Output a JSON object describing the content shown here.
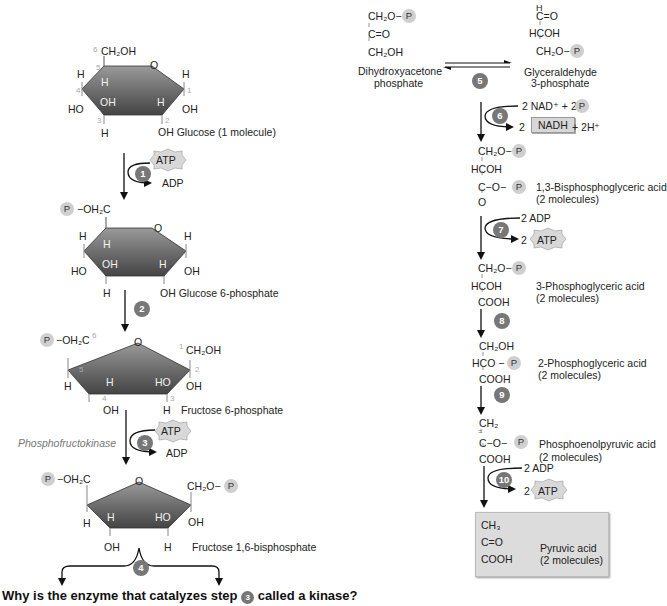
{
  "diagram": {
    "colors": {
      "ring_dark": "#555555",
      "ring_light": "#8a8a8a",
      "phosphate_bg": "#cfcfcf",
      "step_bg": "#777777",
      "highlight_box": "#dcdcdc"
    },
    "phosphate_label": "P",
    "glucose": {
      "name": "OH Glucose (1 molecule)",
      "c6": "CH₂OH",
      "ring_O": "O",
      "numbers": [
        "1",
        "2",
        "3",
        "4",
        "5",
        "6"
      ],
      "subs": {
        "h_left": "H",
        "ho_left": "HO",
        "h_c5": "H",
        "oh_c3": "OH",
        "h_c2": "H",
        "h_right": "H",
        "oh_right": "OH",
        "h_bottom": "H"
      }
    },
    "step1": {
      "number": "1",
      "in": "ATP",
      "out": "ADP"
    },
    "glucose6p": {
      "name": "OH Glucose 6-phosphate",
      "c6": "−OH₂C",
      "subs": {
        "h_left": "H",
        "ho_left": "HO",
        "h_c5": "H",
        "oh_c3": "OH",
        "h_c2": "H",
        "h_right": "H",
        "oh_right": "OH",
        "h_bottom": "H"
      }
    },
    "step2": {
      "number": "2"
    },
    "fructose6p": {
      "name": "Fructose 6-phosphate",
      "c6": "−OH₂C",
      "c1": "CH₂OH",
      "subs": {
        "h_c5": "H",
        "h_c4": "H",
        "ho_c3": "HO",
        "oh_c2": "OH",
        "oh_c4": "OH",
        "h_c3": "H"
      }
    },
    "step3": {
      "number": "3",
      "enzyme": "Phosphofructokinase",
      "in": "ATP",
      "out": "ADP"
    },
    "fructose16bp": {
      "name": "Fructose 1,6-bisphosphate",
      "c6": "−OH₂C",
      "c1": "CH₂O−",
      "subs": {
        "h_c5": "H",
        "h_c4": "H",
        "ho_c3": "HO",
        "oh_c2": "OH",
        "oh_c4": "OH",
        "h_c3": "H"
      }
    },
    "step4": {
      "number": "4"
    },
    "dhap": {
      "lines": [
        "CH₂O−",
        "C=O",
        "CH₂OH"
      ],
      "name": [
        "Dihydroxyacetone",
        "phosphate"
      ]
    },
    "step5": {
      "number": "5"
    },
    "g3p": {
      "lines": [
        "H",
        "C=O",
        "HCOH",
        "CH₂O−"
      ],
      "name": [
        "Glyceraldehyde",
        "3-phosphate"
      ]
    },
    "step6": {
      "number": "6",
      "in": "2 NAD⁺ + 2",
      "out_prefix": "2",
      "out_box": "NADH",
      "out_suffix": "+ 2H⁺"
    },
    "bpg13": {
      "lines": [
        "CH₂O−",
        "HCOH",
        "C−O−",
        "O"
      ],
      "name": "1,3-Bisphosphoglyceric acid",
      "count": "(2 molecules)"
    },
    "step7": {
      "number": "7",
      "in": "2 ADP",
      "out_prefix": "2",
      "out": "ATP"
    },
    "pg3": {
      "lines": [
        "CH₂O−",
        "HCOH",
        "COOH"
      ],
      "name": "3-Phosphoglyceric acid",
      "count": "(2 molecules)"
    },
    "step8": {
      "number": "8"
    },
    "pg2": {
      "lines": [
        "CH₂OH",
        "HCO −",
        "COOH"
      ],
      "name": "2-Phosphoglyceric acid",
      "count": "(2 molecules)"
    },
    "step9": {
      "number": "9"
    },
    "pep": {
      "lines": [
        "CH₂",
        "C−O−",
        "COOH"
      ],
      "name": "Phosphoenolpyruvic acid",
      "count": "(2 molecules)"
    },
    "step10": {
      "number": "10",
      "in": "2 ADP",
      "out_prefix": "2",
      "out": "ATP"
    },
    "pyruvate": {
      "lines": [
        "CH₃",
        "C=O",
        "COOH"
      ],
      "name": "Pyruvic acid",
      "count": "(2 molecules)"
    },
    "question": {
      "before": "Why is the enzyme that catalyzes step",
      "step": "3",
      "after": "called a kinase?"
    }
  }
}
